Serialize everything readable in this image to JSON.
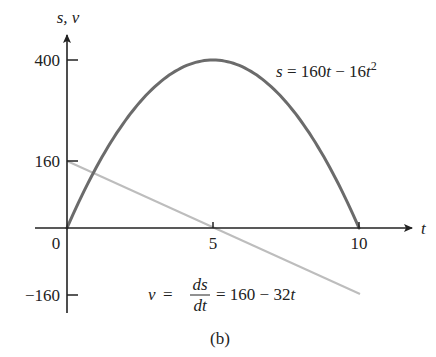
{
  "chart_data": {
    "type": "line",
    "title": "",
    "caption": "(b)",
    "xlabel": "t",
    "ylabel": "s, v",
    "xlim": [
      -1.1,
      11.8
    ],
    "ylim": [
      -175,
      455
    ],
    "grid": false,
    "legend": "none (curves labeled inline)",
    "x_ticks": [
      0,
      5,
      10
    ],
    "x_tick_labels": [
      "0",
      "5",
      "10"
    ],
    "y_ticks": [
      400,
      160,
      -160
    ],
    "y_tick_labels": [
      "400",
      "160",
      "−160"
    ],
    "series": [
      {
        "name": "position",
        "label": "s = 160t − 16t²",
        "formula": "s = 160t - 16t^2",
        "color": "#6b6b6b",
        "x": [
          0,
          1,
          2,
          3,
          4,
          5,
          6,
          7,
          8,
          9,
          10
        ],
        "values": [
          0,
          144,
          256,
          336,
          384,
          400,
          384,
          336,
          256,
          144,
          0
        ]
      },
      {
        "name": "velocity",
        "label": "v = ds/dt = 160 − 32t",
        "formula": "v = 160 - 32t",
        "color": "#bdbdbd",
        "x": [
          0,
          5,
          10
        ],
        "values": [
          160,
          0,
          -160
        ]
      }
    ]
  },
  "labels": {
    "y_axis": "s, v",
    "x_axis": "t",
    "tick_400": "400",
    "tick_160": "160",
    "tick_neg160": "−160",
    "tick_0": "0",
    "tick_5": "5",
    "tick_10": "10",
    "s_eq_lhs": "s",
    "s_eq_mid": " = 160",
    "s_eq_t1": "t",
    "s_eq_minus": " − 16",
    "s_eq_t2": "t",
    "s_eq_exp": "2",
    "v_eq_lhs": "v",
    "v_eq_eq": "=",
    "v_frac_num": "ds",
    "v_frac_den": "dt",
    "v_eq_rhs": "= 160 − 32",
    "v_eq_t": "t",
    "caption": "(b)"
  },
  "colors": {
    "axis": "#222222",
    "position_curve": "#6b6b6b",
    "velocity_line": "#bdbdbd"
  }
}
